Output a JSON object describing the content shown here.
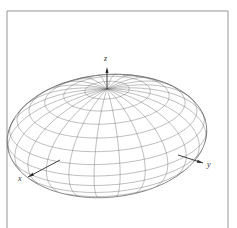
{
  "figure": {
    "type": "ellipsoid-wireframe",
    "frame": {
      "left": 7,
      "top": 11,
      "right": 228,
      "bottom": 228,
      "color": "#8a8a8a"
    },
    "colors": {
      "axis": "#2a2a2a",
      "mesh": "#6e6e6e",
      "label": "#333333"
    },
    "center": {
      "x": 107,
      "y": 136
    },
    "semi_axes": {
      "a": 74,
      "b": 90,
      "c": 47
    },
    "projection": {
      "x_dir": [
        -0.82,
        0.47
      ],
      "y_dir": [
        0.88,
        0.22
      ],
      "z_dir": [
        0,
        -1
      ]
    },
    "mesh": {
      "latitudes": 14,
      "longitudes": 24
    },
    "axes": {
      "z": {
        "label": "z",
        "from": [
          107,
          196
        ],
        "to": [
          107,
          67
        ],
        "label_pos": [
          104,
          61
        ]
      },
      "x": {
        "label": "x",
        "from": [
          60,
          160
        ],
        "to": [
          28,
          177
        ],
        "label_pos": [
          18,
          181
        ]
      },
      "y": {
        "label": "y",
        "from": [
          178,
          155
        ],
        "to": [
          203,
          163
        ],
        "label_pos": [
          207,
          167
        ]
      },
      "x_back": {
        "from": [
          28,
          112
        ],
        "to": [
          40,
          117
        ]
      },
      "y_back": {
        "from": [
          156,
          108
        ],
        "to": [
          162,
          105
        ]
      }
    }
  }
}
